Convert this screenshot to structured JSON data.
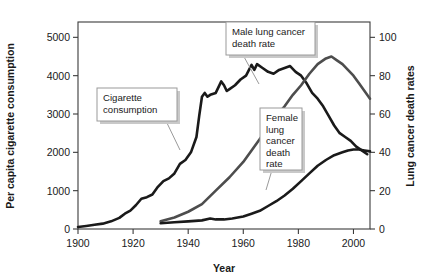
{
  "chart_data": {
    "type": "line",
    "title": "",
    "xlabel": "Year",
    "ylabel": "Per capita cigarette consumption",
    "y2label": "Lung cancer death rates",
    "xlim": [
      1900,
      2006
    ],
    "ylim": [
      0,
      5400
    ],
    "y2lim": [
      0,
      108
    ],
    "grid": false,
    "legend": "none (inline callout labels)",
    "xticks": [
      1900,
      1920,
      1940,
      1960,
      1980,
      2000
    ],
    "xtick_labels": [
      "1900",
      "1920",
      "1940",
      "1960",
      "1980",
      "2000"
    ],
    "yticks": [
      0,
      1000,
      2000,
      3000,
      4000,
      5000
    ],
    "ytick_labels": [
      "0",
      "1000",
      "2000",
      "3000",
      "4000",
      "5000"
    ],
    "y2ticks": [
      0,
      20,
      40,
      60,
      80,
      100
    ],
    "y2tick_labels": [
      "0",
      "20",
      "40",
      "60",
      "80",
      "100"
    ],
    "series": [
      {
        "name": "Cigarette consumption",
        "axis": "left",
        "color": "#1a1a1a",
        "width": 2.6,
        "x": [
          1900,
          1903,
          1906,
          1909,
          1912,
          1915,
          1917,
          1919,
          1921,
          1923,
          1925,
          1927,
          1929,
          1931,
          1933,
          1935,
          1937,
          1939,
          1941,
          1943,
          1944,
          1945,
          1946,
          1947,
          1948,
          1950,
          1952,
          1953,
          1954,
          1955,
          1957,
          1959,
          1961,
          1963,
          1964,
          1965,
          1967,
          1969,
          1971,
          1973,
          1975,
          1977,
          1979,
          1981,
          1983,
          1985,
          1987,
          1989,
          1991,
          1993,
          1995,
          1997,
          1999,
          2001,
          2003,
          2005
        ],
        "y": [
          54,
          80,
          110,
          140,
          200,
          290,
          400,
          480,
          620,
          790,
          830,
          900,
          1100,
          1250,
          1320,
          1450,
          1700,
          1800,
          2000,
          2400,
          2950,
          3450,
          3550,
          3450,
          3500,
          3550,
          3850,
          3750,
          3600,
          3650,
          3750,
          3900,
          4000,
          4280,
          4150,
          4300,
          4200,
          4100,
          4050,
          4150,
          4200,
          4250,
          4100,
          4000,
          3800,
          3550,
          3400,
          3200,
          2950,
          2700,
          2500,
          2400,
          2300,
          2150,
          2050,
          1950
        ]
      },
      {
        "name": "Male lung cancer death rate",
        "axis": "right",
        "color": "#4d4d4d",
        "width": 2.6,
        "x": [
          1930,
          1935,
          1940,
          1945,
          1950,
          1955,
          1960,
          1963,
          1966,
          1969,
          1972,
          1975,
          1978,
          1981,
          1984,
          1987,
          1990,
          1992,
          1994,
          1996,
          1998,
          2000,
          2002,
          2004,
          2006
        ],
        "y": [
          4,
          6,
          9,
          13,
          20,
          27,
          35,
          41,
          47,
          53,
          59,
          64,
          70,
          75,
          81,
          86,
          89,
          90,
          88,
          86,
          83,
          80,
          76,
          72,
          68
        ]
      },
      {
        "name": "Female lung cancer death rate",
        "axis": "right",
        "color": "#1a1a1a",
        "width": 2.6,
        "x": [
          1930,
          1935,
          1940,
          1945,
          1948,
          1950,
          1953,
          1956,
          1960,
          1963,
          1966,
          1969,
          1972,
          1975,
          1978,
          1981,
          1984,
          1987,
          1990,
          1993,
          1996,
          1998,
          2000,
          2002,
          2004,
          2006
        ],
        "y": [
          3,
          3.5,
          4,
          4.5,
          5.5,
          5,
          5,
          5.5,
          6.5,
          8,
          9.5,
          12,
          14.5,
          17.5,
          21,
          25,
          29,
          33,
          36,
          38.5,
          40,
          41,
          41.5,
          41.5,
          41,
          40.5
        ]
      }
    ],
    "annotations": [
      {
        "id": "cigarette-consumption",
        "lines": [
          "Cigarette",
          "consumption"
        ],
        "points_to_series": "Cigarette consumption",
        "box_x": 97,
        "box_y": 88,
        "box_w": 80,
        "box_h": 33,
        "leader": "M 166 121 L 180 150"
      },
      {
        "id": "male-lung-cancer-death-rate",
        "lines": [
          "Male lung cancer",
          "death rate"
        ],
        "points_to_series": "Male lung cancer death rate",
        "box_x": 226,
        "box_y": 22,
        "box_w": 89,
        "box_h": 33,
        "leader": "M 243 55 L 259 84"
      },
      {
        "id": "female-lung-cancer-death-rate",
        "lines": [
          "Female",
          "lung",
          "cancer",
          "death",
          "rate"
        ],
        "points_to_series": "Female lung cancer death rate",
        "box_x": 260,
        "box_y": 108,
        "box_w": 42,
        "box_h": 62,
        "leader": "M 272 170 L 266 190"
      }
    ],
    "colors": {
      "axis": "#3b3b3b",
      "text": "#1a1a1a",
      "callout_border": "#9a9a9a",
      "callout_shadow": "#c9c9c9",
      "background": "#ffffff"
    }
  }
}
